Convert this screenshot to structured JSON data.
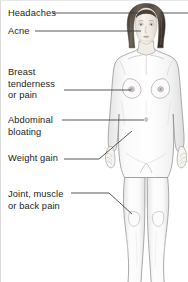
{
  "diagram": {
    "colors": {
      "background": "#ffffff",
      "text": "#1c1c1c",
      "leader_line": "#3a3a3a",
      "body_outline": "#8c8c8c",
      "body_fill": "#fbfbfb",
      "body_shade": "#ededed",
      "hair": "#4a4038",
      "hair_highlight": "#6d6056",
      "skin": "#f3ece6",
      "border": "#dcdcdc"
    },
    "labels": [
      {
        "id": "headaches",
        "lines": [
          "Headaches"
        ],
        "target": "head",
        "leader": "horizontal"
      },
      {
        "id": "acne",
        "lines": [
          "Acne"
        ],
        "target": "face",
        "leader": "horizontal"
      },
      {
        "id": "breast",
        "lines": [
          "Breast",
          "tenderness",
          "or pain"
        ],
        "target": "breast",
        "leader": "horizontal"
      },
      {
        "id": "abdominal",
        "lines": [
          "Abdominal",
          "bloating"
        ],
        "target": "abdomen",
        "leader": "horizontal"
      },
      {
        "id": "weight",
        "lines": [
          "Weight gain"
        ],
        "target": "hip",
        "leader": "diagonal"
      },
      {
        "id": "joint",
        "lines": [
          "Joint, muscle",
          "or back pain"
        ],
        "target": "knee",
        "leader": "horizontal-then-diagonal"
      }
    ]
  }
}
